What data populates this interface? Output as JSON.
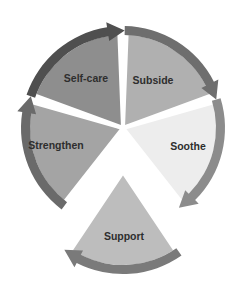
{
  "diagram": {
    "type": "cycle",
    "direction": "clockwise",
    "center": [
      123,
      128
    ],
    "segments": [
      {
        "id": "subside",
        "label": "Subside",
        "fill": "#b0b0b0",
        "arrow": "#6e6e6e",
        "start_deg": -90,
        "end_deg": -18,
        "label_pos": [
          153,
          84
        ]
      },
      {
        "id": "soothe",
        "label": "Soothe",
        "fill": "#ededed",
        "arrow": "#8c8c8c",
        "start_deg": -18,
        "end_deg": 54,
        "label_pos": [
          188,
          150
        ]
      },
      {
        "id": "support",
        "label": "Support",
        "fill": "#bdbdbd",
        "arrow": "#7a7a7a",
        "start_deg": 54,
        "end_deg": 126,
        "label_pos": [
          124,
          240
        ],
        "offset": [
          0,
          44
        ]
      },
      {
        "id": "strengthen",
        "label": "Strengthen",
        "fill": "#a4a4a4",
        "arrow": "#6a6a6a",
        "start_deg": 126,
        "end_deg": 198,
        "label_pos": [
          56,
          149
        ]
      },
      {
        "id": "self-care",
        "label": "Self-care",
        "fill": "#8e8e8e",
        "arrow": "#4f4f4f",
        "start_deg": 198,
        "end_deg": 270,
        "label_pos": [
          86,
          82
        ]
      }
    ]
  }
}
